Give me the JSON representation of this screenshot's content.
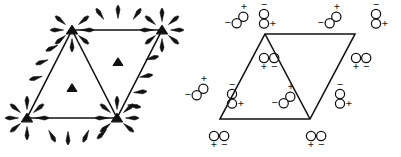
{
  "figure": {
    "background": "#ffffff",
    "ink": "#111111",
    "width": 401,
    "height": 157,
    "panels": [
      {
        "id": "left",
        "name": "arrow-panel",
        "description": "Rhombus made of two triangles with solid triangular markers at vertices and centroids, and arrows radiating outward from vertices and inward along edges",
        "shape": {
          "name": "rhombus",
          "vertices": [
            {
              "label": "top-left",
              "x": 72,
              "y": 30
            },
            {
              "label": "top-right",
              "x": 162,
              "y": 30
            },
            {
              "label": "bottom-right",
              "x": 117,
              "y": 118
            },
            {
              "label": "bottom-left",
              "x": 27,
              "y": 118
            }
          ],
          "diagonal": [
            {
              "x": 72,
              "y": 30
            },
            {
              "x": 117,
              "y": 118
            }
          ]
        },
        "vertex_markers": [
          {
            "name": "vertex-marker-top-left",
            "x": 72,
            "y": 30
          },
          {
            "name": "vertex-marker-top-right",
            "x": 162,
            "y": 30
          },
          {
            "name": "vertex-marker-bottom-right",
            "x": 117,
            "y": 118
          },
          {
            "name": "vertex-marker-bottom-left",
            "x": 27,
            "y": 118
          }
        ],
        "centroid_markers": [
          {
            "name": "centroid-marker-left",
            "x": 72,
            "y": 88
          },
          {
            "name": "centroid-marker-right",
            "x": 118,
            "y": 62
          }
        ],
        "vertex_arrow_fans": [
          {
            "name": "arrow-fan-top-left",
            "cx": 72,
            "cy": 30,
            "angles": [
              -90,
              -140,
              -40,
              180,
              0,
              140,
              40
            ],
            "direction": "outward"
          },
          {
            "name": "arrow-fan-top-right",
            "cx": 162,
            "cy": 30,
            "angles": [
              -90,
              -140,
              -40,
              180,
              0,
              140,
              40,
              90
            ],
            "direction": "outward"
          },
          {
            "name": "arrow-fan-bottom-right",
            "cx": 117,
            "cy": 118,
            "angles": [
              90,
              140,
              40,
              180,
              0,
              -40,
              -140
            ],
            "direction": "outward"
          },
          {
            "name": "arrow-fan-bottom-left",
            "cx": 27,
            "cy": 118,
            "angles": [
              90,
              140,
              40,
              180,
              0,
              -90,
              -140
            ],
            "direction": "outward"
          }
        ],
        "edge_arrows": [
          {
            "name": "edge-arrow-top-1",
            "x": 100,
            "y": 14,
            "angle": 125
          },
          {
            "name": "edge-arrow-top-2",
            "x": 118,
            "y": 12,
            "angle": 90
          },
          {
            "name": "edge-arrow-top-3",
            "x": 137,
            "y": 14,
            "angle": 55
          },
          {
            "name": "edge-arrow-bottom-1",
            "x": 52,
            "y": 136,
            "angle": -60
          },
          {
            "name": "edge-arrow-bottom-2",
            "x": 68,
            "y": 138,
            "angle": -90
          },
          {
            "name": "edge-arrow-bottom-3",
            "x": 86,
            "y": 136,
            "angle": -115
          },
          {
            "name": "edge-arrow-bottom-4",
            "x": 102,
            "y": 134,
            "angle": -135
          },
          {
            "name": "edge-arrow-left-1",
            "x": 42,
            "y": 62,
            "angle": 200
          },
          {
            "name": "edge-arrow-left-2",
            "x": 36,
            "y": 78,
            "angle": 195
          },
          {
            "name": "edge-arrow-left-3",
            "x": 52,
            "y": 48,
            "angle": 205
          },
          {
            "name": "edge-arrow-right-1",
            "x": 152,
            "y": 58,
            "angle": 15
          },
          {
            "name": "edge-arrow-right-2",
            "x": 146,
            "y": 76,
            "angle": 10
          },
          {
            "name": "edge-arrow-right-3",
            "x": 140,
            "y": 92,
            "angle": 5
          },
          {
            "name": "edge-arrow-right-4",
            "x": 134,
            "y": 106,
            "angle": -10
          }
        ]
      },
      {
        "id": "right",
        "name": "dipole-panel",
        "description": "Same rhombus decorated with two-circle charge dipoles labelled plus and minus",
        "shape": {
          "name": "rhombus",
          "vertices": [
            {
              "label": "top-left",
              "x": 265,
              "y": 34
            },
            {
              "label": "top-right",
              "x": 355,
              "y": 34
            },
            {
              "label": "bottom-right",
              "x": 310,
              "y": 119
            },
            {
              "label": "bottom-left",
              "x": 220,
              "y": 119
            }
          ],
          "diagonal": [
            {
              "x": 265,
              "y": 34
            },
            {
              "x": 310,
              "y": 119
            }
          ]
        },
        "dipoles": [
          {
            "name": "dipole-top-outer-left",
            "x": 240,
            "y": 20,
            "orientation": "diagonal",
            "plus": "+",
            "minus": "−",
            "plus_pos": "top-right",
            "minus_pos": "left"
          },
          {
            "name": "dipole-top-vertex-left",
            "x": 264,
            "y": 18,
            "orientation": "vertical",
            "plus": "+",
            "minus": "−",
            "plus_pos": "bottom-right",
            "minus_pos": "top"
          },
          {
            "name": "dipole-top-outer-right",
            "x": 333,
            "y": 20,
            "orientation": "diagonal",
            "plus": "+",
            "minus": "−",
            "plus_pos": "top-right",
            "minus_pos": "left"
          },
          {
            "name": "dipole-top-vertex-right",
            "x": 376,
            "y": 18,
            "orientation": "vertical",
            "plus": "+",
            "minus": "−",
            "plus_pos": "bottom-right",
            "minus_pos": "top"
          },
          {
            "name": "dipole-inner-left",
            "x": 268,
            "y": 58,
            "orientation": "horizontal",
            "plus": "+",
            "minus": "−",
            "plus_pos": "bottom-left",
            "minus_pos": "bottom-right"
          },
          {
            "name": "dipole-inner-right",
            "x": 360,
            "y": 58,
            "orientation": "horizontal",
            "plus": "+",
            "minus": "−",
            "plus_pos": "bottom-left",
            "minus_pos": "bottom-right"
          },
          {
            "name": "dipole-left-edge-outer",
            "x": 200,
            "y": 92,
            "orientation": "diagonal",
            "plus": "+",
            "minus": "−",
            "plus_pos": "top-right",
            "minus_pos": "left"
          },
          {
            "name": "dipole-left-vertex",
            "x": 232,
            "y": 98,
            "orientation": "vertical",
            "plus": "+",
            "minus": "−",
            "plus_pos": "bottom-right",
            "minus_pos": "top"
          },
          {
            "name": "dipole-bottom-inner",
            "x": 287,
            "y": 100,
            "orientation": "diagonal",
            "plus": "+",
            "minus": "−",
            "plus_pos": "top-right",
            "minus_pos": "left"
          },
          {
            "name": "dipole-right-vertex",
            "x": 340,
            "y": 98,
            "orientation": "vertical",
            "plus": "+",
            "minus": "−",
            "plus_pos": "bottom-right",
            "minus_pos": "top"
          },
          {
            "name": "dipole-bottom-left",
            "x": 218,
            "y": 136,
            "orientation": "horizontal",
            "plus": "+",
            "minus": "−",
            "plus_pos": "bottom-left",
            "minus_pos": "bottom-right"
          },
          {
            "name": "dipole-bottom-right",
            "x": 315,
            "y": 136,
            "orientation": "horizontal",
            "plus": "+",
            "minus": "−",
            "plus_pos": "bottom-left",
            "minus_pos": "bottom-right"
          }
        ]
      }
    ]
  }
}
